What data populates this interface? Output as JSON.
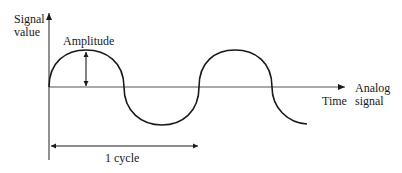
{
  "diagram": {
    "y_axis_label_line1": "Signal",
    "y_axis_label_line2": "value",
    "x_axis_label": "Time",
    "signal_label_line1": "Analog",
    "signal_label_line2": "signal",
    "amplitude_label": "Amplitude",
    "cycle_label": "1 cycle",
    "colors": {
      "stroke": "#1a1a1a",
      "axis": "#555555",
      "background": "#ffffff"
    }
  }
}
